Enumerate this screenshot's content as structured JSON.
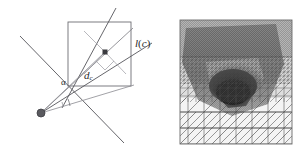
{
  "figure": {
    "background_color": "#ffffff",
    "panels": [
      "geometric-diagram",
      "adaptive-mesh-field"
    ]
  },
  "left_panel": {
    "name": "geometric-diagram",
    "labels": {
      "line_label": "l(c)",
      "line_label_base": "l",
      "line_label_arg": "c",
      "distance_label_base": "d",
      "distance_label_sub": "c",
      "distance_label": "d_c",
      "angle_label": "α"
    },
    "colors": {
      "line": "#55555a",
      "square": "#6e6e73",
      "ray": "#7a7a80",
      "apex_fill": "#5a5a5f",
      "center_fill": "#3a3a3f",
      "text": "#2b2b2b"
    },
    "geometry": {
      "apex": [
        41,
        113
      ],
      "square_top_left": [
        68,
        22
      ],
      "square_bottom_right": [
        131,
        86
      ],
      "center_point": [
        105,
        52
      ],
      "ray_to_center_end": [
        105,
        52
      ],
      "angle_arc_center": [
        41,
        113
      ],
      "right_angle_marker": [
        105,
        52
      ]
    }
  },
  "right_panel": {
    "name": "adaptive-mesh-field",
    "description": "triangular finite element mesh with grayscale scalar field",
    "colors": {
      "mesh_line": "#4a4a4a",
      "background": "#f2f2f2",
      "field_light": "#d9d9d9",
      "field_mid": "#9a9a9a",
      "field_dark": "#5e5e5e",
      "field_darkest": "#1d1d1d",
      "border": "#6b6b6b"
    },
    "bounds": {
      "x": 180,
      "y": 20,
      "width": 112,
      "height": 124
    },
    "mesh_levels": [
      "coarse",
      "medium",
      "fine",
      "very-fine"
    ]
  }
}
